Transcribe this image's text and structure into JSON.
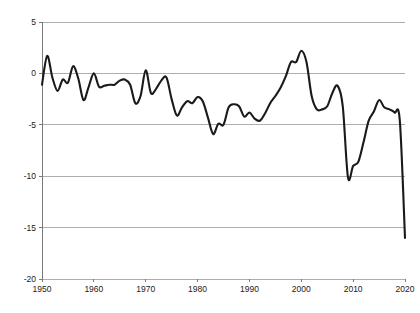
{
  "chart_data": {
    "type": "line",
    "title": "",
    "subtitle": "",
    "xlabel": "",
    "ylabel": "",
    "xlim": [
      1950,
      2020
    ],
    "ylim": [
      -20,
      5
    ],
    "grid": true,
    "legend": false,
    "legend_position": "none",
    "line_color": "#1a1a1a",
    "gridline_color": "#9a9a9a",
    "background_color": "#ffffff",
    "x_ticks": [
      1950,
      1960,
      1970,
      1980,
      1990,
      2000,
      2010,
      2020
    ],
    "x_tick_labels": [
      "1950",
      "1960",
      "1970",
      "1980",
      "1990",
      "2000",
      "2010",
      "2020"
    ],
    "y_ticks": [
      5,
      0,
      -5,
      -10,
      -15,
      -20
    ],
    "y_tick_labels": [
      "5",
      "0",
      "-5",
      "-10",
      "-15",
      "-20"
    ],
    "series": [
      {
        "name": "series-1",
        "color": "#1a1a1a",
        "x": [
          1950,
          1951,
          1952,
          1953,
          1954,
          1955,
          1956,
          1957,
          1958,
          1959,
          1960,
          1961,
          1962,
          1963,
          1964,
          1965,
          1966,
          1967,
          1968,
          1969,
          1970,
          1971,
          1972,
          1973,
          1974,
          1975,
          1976,
          1977,
          1978,
          1979,
          1980,
          1981,
          1982,
          1983,
          1984,
          1985,
          1986,
          1987,
          1988,
          1989,
          1990,
          1991,
          1992,
          1993,
          1994,
          1995,
          1996,
          1997,
          1998,
          1999,
          2000,
          2001,
          2002,
          2003,
          2004,
          2005,
          2006,
          2007,
          2008,
          2009,
          2010,
          2011,
          2012,
          2013,
          2014,
          2015,
          2016,
          2017,
          2018,
          2019,
          2020
        ],
        "values": [
          -1.1,
          1.7,
          -0.4,
          -1.7,
          -0.6,
          -0.9,
          0.7,
          -0.5,
          -2.6,
          -1.3,
          0.0,
          -1.3,
          -1.2,
          -1.1,
          -1.1,
          -0.7,
          -0.6,
          -1.1,
          -2.9,
          -2.2,
          0.3,
          -1.9,
          -1.5,
          -0.7,
          -0.4,
          -2.5,
          -4.1,
          -3.3,
          -2.7,
          -2.9,
          -2.3,
          -2.7,
          -4.3,
          -5.9,
          -4.9,
          -5.0,
          -3.3,
          -3.0,
          -3.2,
          -4.2,
          -3.8,
          -4.4,
          -4.6,
          -3.9,
          -2.9,
          -2.2,
          -1.4,
          -0.3,
          1.1,
          1.1,
          2.2,
          1.1,
          -2.2,
          -3.5,
          -3.5,
          -3.2,
          -1.9,
          -1.2,
          -3.2,
          -10.1,
          -9.0,
          -8.6,
          -6.7,
          -4.6,
          -3.7,
          -2.6,
          -3.3,
          -3.5,
          -3.8,
          -4.6,
          -16.0
        ]
      }
    ]
  },
  "axes": {
    "y_axis_name": "y-axis",
    "x_axis_name": "x-axis"
  }
}
